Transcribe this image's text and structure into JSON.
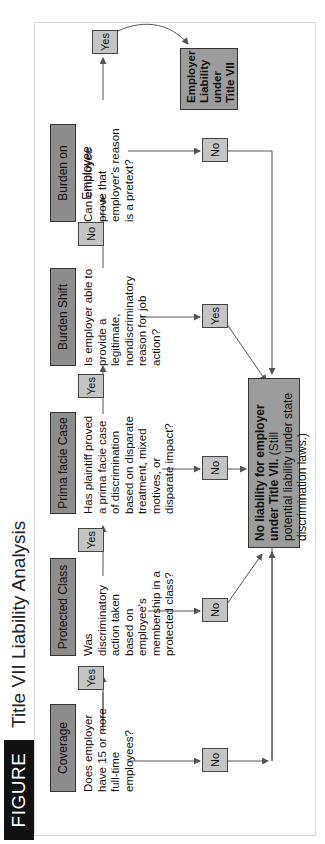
{
  "figure": {
    "label": "FIGURE 12.1",
    "title": "Title VII Liability Analysis"
  },
  "stages": [
    {
      "name": "Coverage",
      "question": "Does employer have 15 or more full-time employees?",
      "no_label": "No",
      "yes_label": "Yes"
    },
    {
      "name": "Protected Class",
      "question": "Was discriminatory action taken based on employee's membership in a protected class?",
      "no_label": "No",
      "yes_label": "Yes"
    },
    {
      "name": "Prima facie Case",
      "question": "Has plaintiff proved a prima facie case of discrimination based on disparate treatment, mixed motives, or disparate impact?",
      "no_label": "No",
      "yes_label": "Yes"
    },
    {
      "name": "Burden Shift",
      "question": "Is employer able to provide a legitimate, nondiscriminatory reason for job action?",
      "yes_label": "Yes",
      "no_label": "No"
    },
    {
      "name": "Burden on Employee",
      "question": "Can employee prove that employer's reason is a pretext?",
      "no_label": "No",
      "yes_label": "Yes"
    }
  ],
  "outcomes": {
    "no_liability_bold": "No liability for employer under Title VII.",
    "no_liability_rest": " (Still potential liability under state discrimination laws.)",
    "liability": "Employer Liability under Title VII"
  },
  "colors": {
    "stage_box": "#8d8d8d",
    "answer_box": "#c4c4c4",
    "outcome_box": "#9c9c9c",
    "figure_label_bg": "#111111",
    "line": "#555555"
  }
}
